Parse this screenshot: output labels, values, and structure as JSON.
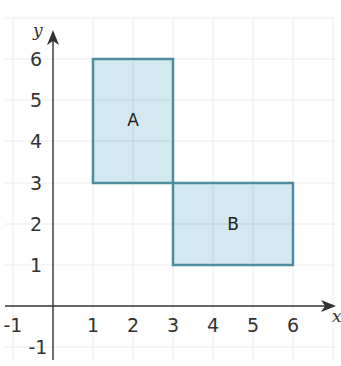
{
  "diagram": {
    "type": "coordinate-grid",
    "axes": {
      "x_label": "x",
      "y_label": "y"
    },
    "x_ticks": [
      "-1",
      "1",
      "2",
      "3",
      "4",
      "5",
      "6"
    ],
    "y_ticks": [
      "-1",
      "1",
      "2",
      "3",
      "4",
      "5",
      "6"
    ],
    "x_range": [
      -1,
      7
    ],
    "y_range": [
      -1,
      7
    ],
    "colors": {
      "fill": "#d3e8ef",
      "stroke": "#4e8d9e",
      "grid": "#ececec",
      "axis": "#333333"
    },
    "shapes": [
      {
        "label": "A",
        "x1": 1,
        "y1": 3,
        "x2": 3,
        "y2": 6
      },
      {
        "label": "B",
        "x1": 3,
        "y1": 1,
        "x2": 6,
        "y2": 3
      }
    ]
  }
}
